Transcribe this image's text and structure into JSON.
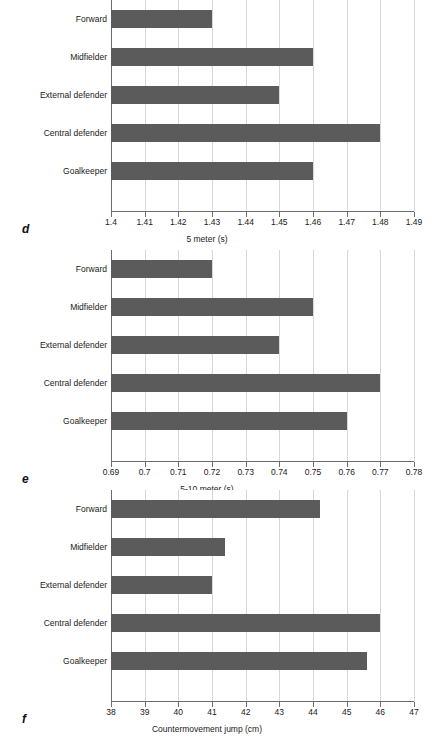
{
  "figure": {
    "panels": [
      {
        "letter": "d",
        "xlabel": "5 meter (s)",
        "categories": [
          "Forward",
          "Midfielder",
          "External defender",
          "Central defender",
          "Goalkeeper"
        ],
        "values": [
          1.43,
          1.46,
          1.45,
          1.48,
          1.46
        ],
        "ticks": [
          1.4,
          1.41,
          1.42,
          1.43,
          1.44,
          1.45,
          1.46,
          1.47,
          1.48,
          1.49
        ],
        "tick_labels": [
          "1.4",
          "1.41",
          "1.42",
          "1.43",
          "1.44",
          "1.45",
          "1.46",
          "1.47",
          "1.48",
          "1.49"
        ],
        "xmin": 1.4,
        "xmax": 1.49
      },
      {
        "letter": "e",
        "xlabel": "5-10 meter (s)",
        "categories": [
          "Forward",
          "Midfielder",
          "External defender",
          "Central defender",
          "Goalkeeper"
        ],
        "values": [
          0.72,
          0.75,
          0.74,
          0.77,
          0.76
        ],
        "ticks": [
          0.69,
          0.7,
          0.71,
          0.72,
          0.73,
          0.74,
          0.75,
          0.76,
          0.77,
          0.78
        ],
        "tick_labels": [
          "0.69",
          "0.7",
          "0.71",
          "0.72",
          "0.73",
          "0.74",
          "0.75",
          "0.76",
          "0.77",
          "0.78"
        ],
        "xmin": 0.69,
        "xmax": 0.78
      },
      {
        "letter": "f",
        "xlabel": "Countermovement jump (cm)",
        "categories": [
          "Forward",
          "Midfielder",
          "External defender",
          "Central defender",
          "Goalkeeper"
        ],
        "values": [
          44.2,
          41.4,
          41.0,
          46.0,
          45.6
        ],
        "ticks": [
          38,
          39,
          40,
          41,
          42,
          43,
          44,
          45,
          46,
          47
        ],
        "tick_labels": [
          "38",
          "39",
          "40",
          "41",
          "42",
          "43",
          "44",
          "45",
          "46",
          "47"
        ],
        "xmin": 38,
        "xmax": 47
      }
    ],
    "colors": {
      "bar": "#5b5b5b",
      "gridline": "#d8d8d8",
      "axis": "#6d6d6d",
      "text": "#1a1a1a",
      "background": "#ffffff"
    }
  },
  "chart_data": [
    {
      "type": "bar",
      "orientation": "horizontal",
      "panel": "d",
      "title": "",
      "xlabel": "5 meter (s)",
      "ylabel": "",
      "categories": [
        "Forward",
        "Midfielder",
        "External defender",
        "Central defender",
        "Goalkeeper"
      ],
      "values": [
        1.43,
        1.46,
        1.45,
        1.48,
        1.46
      ],
      "xlim": [
        1.4,
        1.49
      ],
      "xticks": [
        1.4,
        1.41,
        1.42,
        1.43,
        1.44,
        1.45,
        1.46,
        1.47,
        1.48,
        1.49
      ],
      "grid": "vertical",
      "legend": "none"
    },
    {
      "type": "bar",
      "orientation": "horizontal",
      "panel": "e",
      "title": "",
      "xlabel": "5-10 meter (s)",
      "ylabel": "",
      "categories": [
        "Forward",
        "Midfielder",
        "External defender",
        "Central defender",
        "Goalkeeper"
      ],
      "values": [
        0.72,
        0.75,
        0.74,
        0.77,
        0.76
      ],
      "xlim": [
        0.69,
        0.78
      ],
      "xticks": [
        0.69,
        0.7,
        0.71,
        0.72,
        0.73,
        0.74,
        0.75,
        0.76,
        0.77,
        0.78
      ],
      "grid": "vertical",
      "legend": "none"
    },
    {
      "type": "bar",
      "orientation": "horizontal",
      "panel": "f",
      "title": "",
      "xlabel": "Countermovement jump (cm)",
      "ylabel": "",
      "categories": [
        "Forward",
        "Midfielder",
        "External defender",
        "Central defender",
        "Goalkeeper"
      ],
      "values": [
        44.2,
        41.4,
        41.0,
        46.0,
        45.6
      ],
      "xlim": [
        38,
        47
      ],
      "xticks": [
        38,
        39,
        40,
        41,
        42,
        43,
        44,
        45,
        46,
        47
      ],
      "grid": "vertical",
      "legend": "none"
    }
  ]
}
